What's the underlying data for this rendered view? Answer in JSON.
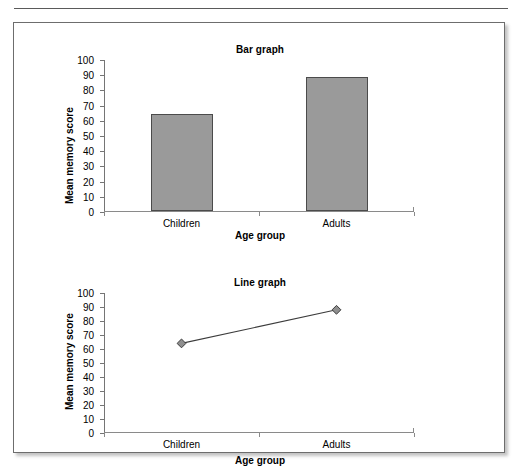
{
  "page": {
    "background": "#ffffff",
    "rule_color": "#5a5a5a",
    "box_border_color": "#6d6d6d"
  },
  "charts": [
    {
      "id": "bar-graph",
      "title": "Bar graph",
      "xlabel": "Age group",
      "ylabel": "Mean memory score"
    },
    {
      "id": "line-graph",
      "title": "Line graph",
      "xlabel": "Age group",
      "ylabel": "Mean memory score"
    }
  ],
  "chart_data": [
    {
      "type": "bar",
      "title": "Bar graph",
      "xlabel": "Age group",
      "ylabel": "Mean memory score",
      "categories": [
        "Children",
        "Adults"
      ],
      "values": [
        64,
        88
      ],
      "ylim": [
        0,
        100
      ],
      "yticks": [
        0,
        10,
        20,
        30,
        40,
        50,
        60,
        70,
        80,
        90,
        100
      ],
      "ytick_labels": [
        "0",
        "10",
        "20",
        "30",
        "40",
        "50",
        "60",
        "70",
        "80",
        "90",
        "100"
      ],
      "grid": false,
      "legend": "none",
      "bar_fill": "#9a9a9a",
      "bar_border": "#4b4b4b"
    },
    {
      "type": "line",
      "title": "Line graph",
      "xlabel": "Age group",
      "ylabel": "Mean memory score",
      "categories": [
        "Children",
        "Adults"
      ],
      "values": [
        64,
        88
      ],
      "ylim": [
        0,
        100
      ],
      "yticks": [
        0,
        10,
        20,
        30,
        40,
        50,
        60,
        70,
        80,
        90,
        100
      ],
      "ytick_labels": [
        "0",
        "10",
        "20",
        "30",
        "40",
        "50",
        "60",
        "70",
        "80",
        "90",
        "100"
      ],
      "grid": false,
      "legend": "none",
      "marker": "diamond",
      "marker_fill": "#8f8f8f",
      "marker_border": "#3c3c3c",
      "line_color": "#3c3c3c"
    }
  ]
}
